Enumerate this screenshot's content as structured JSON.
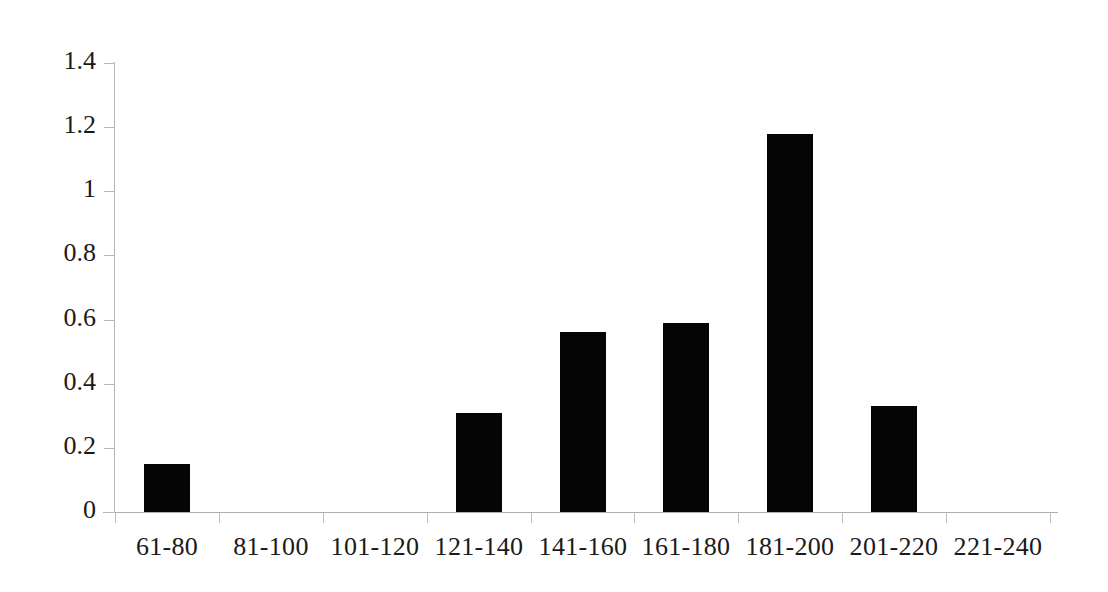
{
  "chart_data": {
    "type": "bar",
    "title": "",
    "subtitle": "",
    "xlabel": "",
    "ylabel": "",
    "categories": [
      "61-80",
      "81-100",
      "101-120",
      "121-140",
      "141-160",
      "161-180",
      "181-200",
      "201-220",
      "221-240"
    ],
    "values": [
      0.15,
      0,
      0,
      0.31,
      0.56,
      0.59,
      1.18,
      0.33,
      0
    ],
    "ytick_labels": [
      "0",
      "0.2",
      "0.4",
      "0.6",
      "0.8",
      "1",
      "1.2",
      "1.4"
    ],
    "ytick_values": [
      0,
      0.2,
      0.4,
      0.6,
      0.8,
      1,
      1.2,
      1.4
    ],
    "ylim": [
      0,
      1.4
    ],
    "grid": false,
    "legend": false,
    "legend_position": "none",
    "series": [
      {
        "name": "",
        "values": [
          0.15,
          0,
          0,
          0.31,
          0.56,
          0.59,
          1.18,
          0.33,
          0
        ]
      }
    ],
    "colors": {
      "bar": "#050505",
      "axis": "#b9b9b9",
      "text": "#1a1a1a",
      "background": "#ffffff"
    }
  }
}
